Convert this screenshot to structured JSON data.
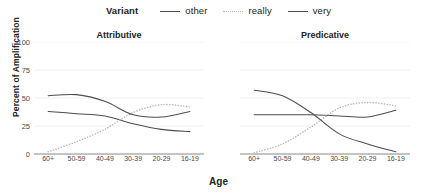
{
  "legend": {
    "title": "Variant",
    "items": [
      {
        "label": "other",
        "style": "solid",
        "color": "#4d4d4d"
      },
      {
        "label": "really",
        "style": "dotted",
        "color": "#b9b9b9"
      },
      {
        "label": "very",
        "style": "solid",
        "color": "#4d4d4d"
      }
    ]
  },
  "axes": {
    "ylabel": "Percent of Amplification",
    "xlabel": "Age"
  },
  "chart_data": {
    "type": "line",
    "title": "",
    "xlabel": "Age",
    "ylabel": "Percent of Amplification",
    "ylim": [
      0,
      100
    ],
    "yticks": [
      0,
      25,
      50,
      75,
      100
    ],
    "categories": [
      "60+",
      "50-59",
      "40-49",
      "30-39",
      "20-29",
      "16-19"
    ],
    "grid": true,
    "legend_position": "top",
    "facets": [
      {
        "name": "Attributive",
        "series": [
          {
            "name": "other",
            "style": "solid",
            "color": "#4d4d4d",
            "values": [
              38,
              36,
              34,
              27,
              22,
              20
            ]
          },
          {
            "name": "really",
            "style": "dotted",
            "color": "#b9b9b9",
            "values": [
              2,
              11,
              22,
              37,
              44,
              42
            ]
          },
          {
            "name": "very",
            "style": "solid",
            "color": "#4d4d4d",
            "values": [
              52,
              53,
              47,
              35,
              33,
              38
            ]
          }
        ]
      },
      {
        "name": "Predicative",
        "series": [
          {
            "name": "other",
            "style": "solid",
            "color": "#4d4d4d",
            "values": [
              35,
              35,
              35,
              34,
              33,
              39
            ]
          },
          {
            "name": "really",
            "style": "dotted",
            "color": "#b9b9b9",
            "values": [
              1,
              9,
              24,
              41,
              46,
              43
            ]
          },
          {
            "name": "very",
            "style": "solid",
            "color": "#4d4d4d",
            "values": [
              57,
              52,
              37,
              18,
              9,
              2
            ]
          }
        ]
      }
    ]
  }
}
